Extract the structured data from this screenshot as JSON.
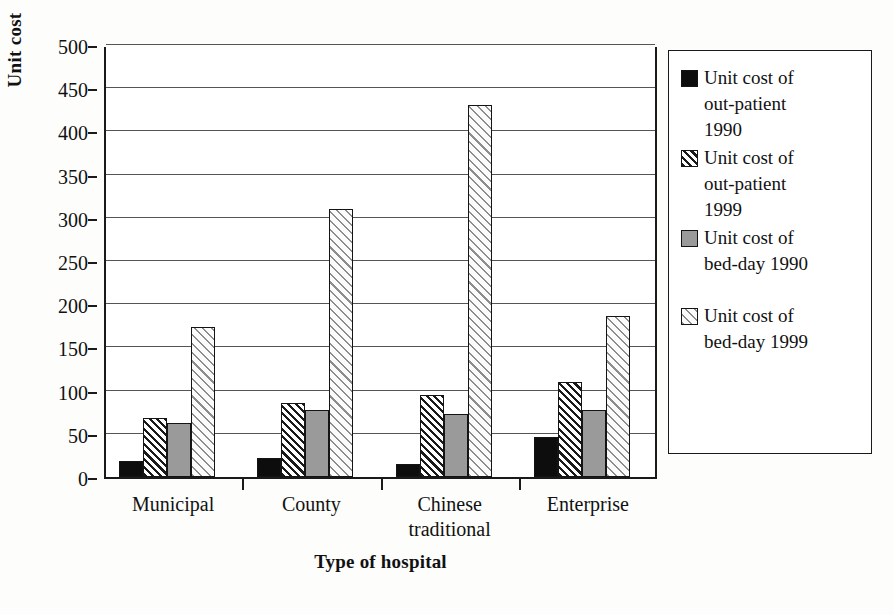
{
  "chart_data": {
    "type": "bar",
    "title": "",
    "xlabel": "Type of hospital",
    "ylabel": "Unit cost",
    "ylim": [
      0,
      500
    ],
    "ytick_step": 50,
    "yticks": [
      "0",
      "50",
      "100",
      "150",
      "200",
      "250",
      "300",
      "350",
      "400",
      "450",
      "500"
    ],
    "grid": "horizontal",
    "legend_position": "right",
    "categories": [
      "Municipal",
      "County",
      "Chinese traditional",
      "Enterprise"
    ],
    "category_lines": [
      [
        "Municipal"
      ],
      [
        "County"
      ],
      [
        "Chinese",
        "traditional"
      ],
      [
        "Enterprise"
      ]
    ],
    "series": [
      {
        "name": "Unit cost of out-patient 1990",
        "name_lines": [
          "Unit cost of",
          "out-patient",
          "1990"
        ],
        "pattern": "solid-black",
        "color": "#0d0d0d",
        "values": [
          18,
          22,
          15,
          46
        ]
      },
      {
        "name": "Unit cost of out-patient 1999",
        "name_lines": [
          "Unit cost of",
          "out-patient",
          "1999"
        ],
        "pattern": "dense-diagonal-hatch",
        "color": "#1a1a1a",
        "values": [
          68,
          86,
          95,
          110
        ]
      },
      {
        "name": "Unit cost of bed-day 1990",
        "name_lines": [
          "Unit cost of",
          "bed-day 1990"
        ],
        "pattern": "gray-fill",
        "color": "#9a9a9a",
        "values": [
          62,
          78,
          73,
          77
        ]
      },
      {
        "name": "Unit cost of bed-day 1999",
        "name_lines": [
          "Unit cost of",
          "bed-day 1999"
        ],
        "pattern": "light-diagonal-hatch",
        "color": "#8d8d8d",
        "values": [
          174,
          310,
          430,
          186
        ]
      }
    ]
  },
  "axes": {
    "y_title": "Unit cost",
    "x_title": "Type of hospital"
  }
}
